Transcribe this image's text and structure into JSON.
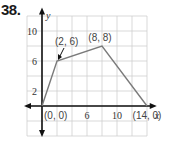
{
  "problem": {
    "number": "38."
  },
  "chart_data": {
    "type": "line",
    "title": "",
    "xlabel": "x",
    "ylabel": "y",
    "x": [
      0,
      2,
      8,
      14
    ],
    "series": [
      {
        "name": "piecewise",
        "values": [
          0,
          6,
          8,
          0
        ]
      }
    ],
    "points": [
      {
        "label": "(0, 0)",
        "x": 0,
        "y": 0
      },
      {
        "label": "(2, 6)",
        "x": 2,
        "y": 6
      },
      {
        "label": "(8, 8)",
        "x": 8,
        "y": 8
      },
      {
        "label": "(14, 0)",
        "x": 14,
        "y": 0
      }
    ],
    "x_ticks": [
      {
        "value": 6,
        "label": "6"
      },
      {
        "value": 10,
        "label": "10"
      }
    ],
    "y_ticks": [
      {
        "value": 2,
        "label": "2"
      },
      {
        "value": 6,
        "label": "6"
      },
      {
        "value": 10,
        "label": "10"
      }
    ],
    "xlim": [
      -2,
      14
    ],
    "ylim": [
      -4,
      12
    ],
    "grid": true,
    "grid_step": 2,
    "legend": "none",
    "colors": {
      "line": "#7a7a7a",
      "axis": "#111111",
      "grid": "#cfcfcf"
    }
  }
}
